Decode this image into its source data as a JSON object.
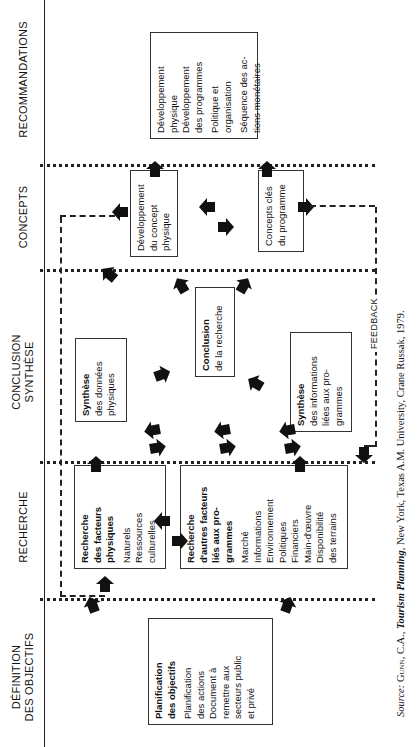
{
  "columns": [
    {
      "id": "definition",
      "label_line1": "DÉFINITION",
      "label_line2": "DES OBJECTIFS"
    },
    {
      "id": "recherche",
      "label_line1": "RECHERCHE",
      "label_line2": ""
    },
    {
      "id": "conclusion",
      "label_line1": "CONCLUSION",
      "label_line2": "SYNTHÈSE"
    },
    {
      "id": "concepts",
      "label_line1": "CONCEPTS",
      "label_line2": ""
    },
    {
      "id": "recommandations",
      "label_line1": "RECOMMANDATIONS",
      "label_line2": ""
    }
  ],
  "boxes": {
    "planification": {
      "title_l1": "Planification",
      "title_l2": "des objectifs",
      "items": [
        "Planification",
        "des actions",
        "Document à",
        "remettre aux",
        "secteurs public",
        "et privé"
      ]
    },
    "recherche_physiques": {
      "title_l1": "Recherche",
      "title_l2": "des facteurs",
      "title_l3": "physiques",
      "items": [
        "Naturels",
        "Ressources",
        "culturelles"
      ]
    },
    "recherche_autres": {
      "title_l1": "Recherche",
      "title_l2": "d'autres facteurs",
      "title_l3": "liés aux pro-",
      "title_l4": "grammes",
      "items": [
        "Marché",
        "Informations",
        "Environnement",
        "Politiques",
        "Financiers",
        "Main-d'œuvre",
        "Disponibilité",
        "des terrains"
      ]
    },
    "synthese_physiques": {
      "title": "Synthèse",
      "items": [
        "des données",
        "physiques"
      ]
    },
    "conclusion_recherche": {
      "title": "Conclusion",
      "items": [
        "de la recherche"
      ]
    },
    "synthese_programmes": {
      "title": "Synthèse",
      "items": [
        "des informations",
        "liées aux pro-",
        "grammes"
      ]
    },
    "concept_physique": {
      "items": [
        "Développement",
        "du concept",
        "physique"
      ]
    },
    "concepts_programme": {
      "items": [
        "Concepts clés",
        "du programme"
      ]
    },
    "recommandations": {
      "items": [
        "Développement",
        "physique",
        "Développement",
        "des programmes",
        "Politique et",
        "organisation",
        "Séquence des ac-",
        "tions monétaires"
      ]
    }
  },
  "feedback": {
    "label": "FEEDBACK"
  },
  "source": {
    "prefix": "Source",
    "author": "Gunn, C.A.,",
    "title": "Tourism Planning",
    "rest": ", New York, Texas A.M. University, Crane Russak, 1979."
  },
  "colors": {
    "ink": "#111111",
    "background": "#ffffff"
  }
}
